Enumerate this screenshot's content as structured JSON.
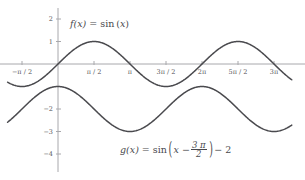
{
  "chart_data": {
    "type": "line",
    "title": "",
    "xlabel": "",
    "ylabel": "",
    "xlim": [
      -2.2,
      10.2
    ],
    "ylim": [
      -4.6,
      2.4
    ],
    "grid": false,
    "legend_position": "inline-annotation",
    "x_unit": "pi",
    "x_ticks": [
      {
        "value": -1.5707963,
        "label": "−π / 2"
      },
      {
        "value": 1.5707963,
        "label": "π / 2"
      },
      {
        "value": 3.1415927,
        "label": "π"
      },
      {
        "value": 4.712389,
        "label": "3π / 2"
      },
      {
        "value": 6.2831853,
        "label": "2π"
      },
      {
        "value": 7.8539816,
        "label": "5π / 2"
      },
      {
        "value": 9.424778,
        "label": "3π"
      }
    ],
    "y_ticks": [
      {
        "value": 2,
        "label": "2"
      },
      {
        "value": 1,
        "label": "1"
      },
      {
        "value": -2,
        "label": "−2"
      },
      {
        "value": -3,
        "label": "−3"
      },
      {
        "value": -4,
        "label": "−4"
      }
    ],
    "series": [
      {
        "name": "f",
        "expression": "sin(x)",
        "amplitude": 1,
        "phase_shift": 0,
        "vertical_shift": 0,
        "color": "#4a4a4e",
        "key_points": [
          {
            "x": -1.5707963,
            "y": -1
          },
          {
            "x": 0,
            "y": 0
          },
          {
            "x": 1.5707963,
            "y": 1
          },
          {
            "x": 3.1415927,
            "y": 0
          },
          {
            "x": 4.712389,
            "y": -1
          },
          {
            "x": 6.2831853,
            "y": 0
          },
          {
            "x": 7.8539816,
            "y": 1
          },
          {
            "x": 9.424778,
            "y": 0
          }
        ]
      },
      {
        "name": "g",
        "expression": "sin(x - 3pi/2) - 2",
        "amplitude": 1,
        "phase_shift": 4.712389,
        "vertical_shift": -2,
        "color": "#4a4a4e",
        "key_points": [
          {
            "x": -1.5707963,
            "y": -3
          },
          {
            "x": 0,
            "y": -1
          },
          {
            "x": 1.5707963,
            "y": -2
          },
          {
            "x": 3.1415927,
            "y": -3
          },
          {
            "x": 4.712389,
            "y": -2
          },
          {
            "x": 6.2831853,
            "y": -1
          },
          {
            "x": 7.8539816,
            "y": -2
          },
          {
            "x": 9.424778,
            "y": -3
          }
        ]
      }
    ],
    "annotations": [
      {
        "id": "f-label",
        "name": "f(x)",
        "equals": "=",
        "func": "sin",
        "arg": "x",
        "text": "f(x) = sin (x)"
      },
      {
        "id": "g-label",
        "name": "g(x)",
        "equals": "=",
        "func": "sin",
        "arg_lead": "x −",
        "frac_num": "3 π",
        "frac_den": "2",
        "tail": "− 2",
        "text": "g(x) = sin (x − 3π/2) − 2"
      }
    ],
    "colors": {
      "curve": "#4a4a4e",
      "axis": "#a8a8ac",
      "tick_label": "#56565a",
      "background": "#ffffff"
    }
  }
}
